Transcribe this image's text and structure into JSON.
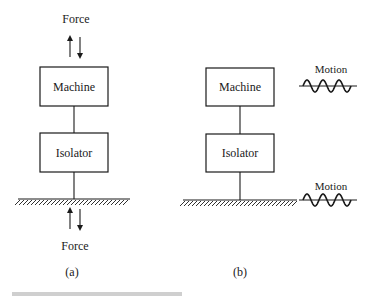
{
  "figure": {
    "panel_a": {
      "label": "(a)",
      "top_force_label": "Force",
      "bottom_force_label": "Force",
      "machine_label": "Machine",
      "isolator_label": "Isolator",
      "force_arrows": [
        "up-arrow",
        "down-arrow"
      ]
    },
    "panel_b": {
      "label": "(b)",
      "machine_label": "Machine",
      "isolator_label": "Isolator",
      "top_motion_label": "Motion",
      "bottom_motion_label": "Motion",
      "wave_cycles": 3
    },
    "caption_partial": "Figure (caption cut off)"
  }
}
